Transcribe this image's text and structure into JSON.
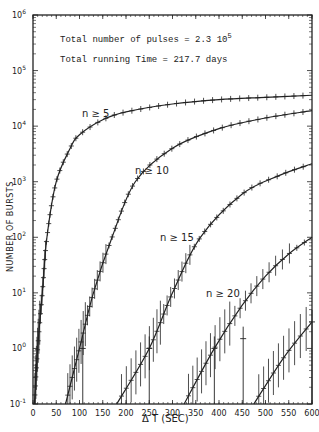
{
  "chart_data": {
    "type": "line",
    "title": "",
    "xlabel": "Δ T (SEC)",
    "ylabel": "NUMBER OF BURSTS",
    "xlim": [
      0,
      600
    ],
    "ylim": [
      0.1,
      1000000
    ],
    "yscale": "log",
    "x_ticks": [
      "0",
      "50",
      "100",
      "150",
      "200",
      "250",
      "300",
      "350",
      "400",
      "450",
      "500",
      "550",
      "600"
    ],
    "y_ticks": [
      "10^-1",
      "10^0",
      "10^1",
      "10^2",
      "10^3",
      "10^4",
      "10^5",
      "10^6"
    ],
    "annotations": [
      "Total number of pulses = 2.3 10^5",
      "Total running Time = 217.7 days"
    ],
    "series": [
      {
        "name": "n ≥ 5",
        "x": [
          3,
          10,
          20,
          30,
          50,
          80,
          100,
          150,
          200,
          300,
          400,
          500,
          600
        ],
        "values": [
          0.1,
          1,
          10,
          100,
          1000,
          4000,
          7000,
          13000,
          18000,
          25000,
          30000,
          33000,
          36000
        ]
      },
      {
        "name": "n ≥ 10",
        "x": [
          70,
          100,
          130,
          170,
          220,
          300,
          400,
          500,
          600
        ],
        "values": [
          0.1,
          1,
          10,
          100,
          1000,
          4000,
          9000,
          14000,
          19000
        ]
      },
      {
        "name": "n ≥ 15",
        "x": [
          180,
          250,
          300,
          360,
          450,
          530,
          600
        ],
        "values": [
          0.1,
          1,
          10,
          100,
          600,
          1300,
          2100
        ]
      },
      {
        "name": "n ≥ 20",
        "x": [
          325,
          390,
          450,
          500,
          550,
          600
        ],
        "values": [
          0.1,
          1,
          6,
          20,
          50,
          100
        ]
      },
      {
        "name": "n ≥ 25",
        "x": [
          475,
          540,
          600
        ],
        "values": [
          0.1,
          0.7,
          3
        ]
      }
    ],
    "grid": false,
    "legend": "inline labels"
  },
  "labels": {
    "annotation_1": "Total number of pulses = 2.3 10",
    "annotation_1_exp": "5",
    "annotation_2": "Total running Time = 217.7 days",
    "ylabel": "NUMBER OF BURSTS",
    "xlabel": "Δ T (SEC)",
    "curve_labels": [
      "n ≥ 5",
      "n ≥ 10",
      "n ≥ 15",
      "n ≥ 20"
    ]
  }
}
